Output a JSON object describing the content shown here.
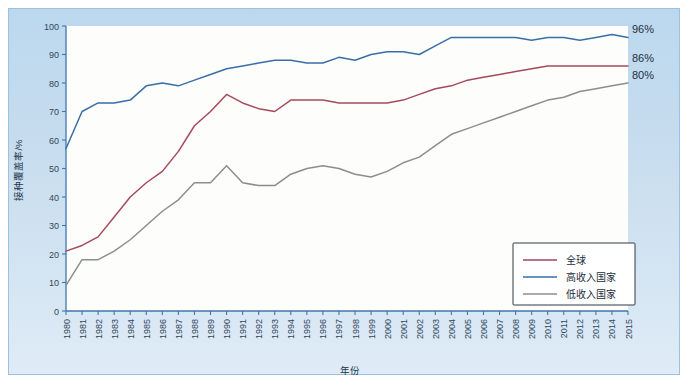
{
  "chart_data": {
    "type": "line",
    "title": "",
    "xlabel": "年份",
    "ylabel": "接种覆盖率/%",
    "xlim": [
      1980,
      2015
    ],
    "ylim": [
      0,
      100
    ],
    "grid": false,
    "legend_position": "bottom-right",
    "x": [
      1980,
      1981,
      1982,
      1983,
      1984,
      1985,
      1986,
      1987,
      1988,
      1989,
      1990,
      1991,
      1992,
      1993,
      1994,
      1995,
      1996,
      1997,
      1998,
      1999,
      2000,
      2001,
      2002,
      2003,
      2004,
      2005,
      2006,
      2007,
      2008,
      2009,
      2010,
      2011,
      2012,
      2013,
      2014,
      2015
    ],
    "xticklabels": [
      "1980",
      "1981",
      "1982",
      "1983",
      "1984",
      "1985",
      "1986",
      "1987",
      "1988",
      "1989",
      "1990",
      "1991",
      "1992",
      "1993",
      "1994",
      "1995",
      "1996",
      "1997",
      "1998",
      "1999",
      "2000",
      "2001",
      "2002",
      "2003",
      "2004",
      "2005",
      "2006",
      "2007",
      "2008",
      "2009",
      "2010",
      "2011",
      "2012",
      "2013",
      "2014",
      "2015"
    ],
    "yticklabels": [
      "0",
      "10",
      "20",
      "30",
      "40",
      "50",
      "60",
      "70",
      "80",
      "90",
      "100"
    ],
    "yticks": [
      0,
      10,
      20,
      30,
      40,
      50,
      60,
      70,
      80,
      90,
      100
    ],
    "series": [
      {
        "name": "全球",
        "color": "#a5495c",
        "values": [
          21,
          23,
          26,
          33,
          40,
          45,
          49,
          56,
          65,
          70,
          76,
          73,
          71,
          70,
          74,
          74,
          74,
          73,
          73,
          73,
          73,
          74,
          76,
          78,
          79,
          81,
          82,
          83,
          84,
          85,
          86,
          86,
          86,
          86,
          86,
          86
        ]
      },
      {
        "name": "高收入国家",
        "color": "#3a6ea5",
        "values": [
          57,
          70,
          73,
          73,
          74,
          79,
          80,
          79,
          81,
          83,
          85,
          86,
          87,
          88,
          88,
          87,
          87,
          89,
          88,
          90,
          91,
          91,
          90,
          93,
          96,
          96,
          96,
          96,
          96,
          95,
          96,
          96,
          95,
          96,
          97,
          96
        ]
      },
      {
        "name": "低收入国家",
        "color": "#8b9087",
        "values": [
          9,
          18,
          18,
          21,
          25,
          30,
          35,
          39,
          45,
          45,
          51,
          45,
          44,
          44,
          48,
          50,
          51,
          50,
          48,
          47,
          49,
          52,
          54,
          58,
          62,
          64,
          66,
          68,
          70,
          72,
          74,
          75,
          77,
          78,
          79,
          80
        ]
      }
    ],
    "annotations": [
      {
        "text": "96%",
        "series": "高收入国家",
        "x": 2015,
        "y": 96
      },
      {
        "text": "86%",
        "series": "全球",
        "x": 2015,
        "y": 86
      },
      {
        "text": "80%",
        "series": "低收入国家",
        "x": 2015,
        "y": 80
      }
    ]
  },
  "legend": {
    "items": [
      {
        "label": "全球",
        "color": "#a5495c"
      },
      {
        "label": "高收入国家",
        "color": "#3a6ea5"
      },
      {
        "label": "低收入国家",
        "color": "#8b9087"
      }
    ]
  },
  "axes": {
    "y_title": "接种覆盖率/%",
    "x_title": "年份"
  }
}
